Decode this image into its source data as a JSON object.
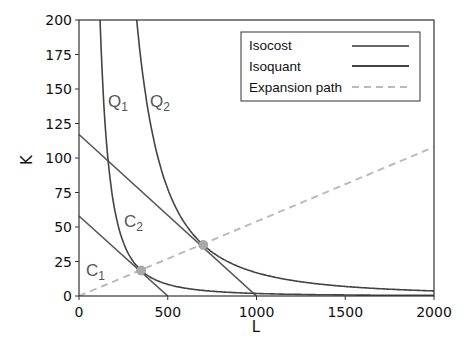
{
  "chart_data": {
    "type": "line",
    "title": "",
    "xlabel": "L",
    "ylabel": "K",
    "xlim": [
      0,
      2000
    ],
    "ylim": [
      0,
      200
    ],
    "xticks": [
      0,
      500,
      1000,
      1500,
      2000
    ],
    "yticks": [
      0,
      25,
      50,
      75,
      100,
      125,
      150,
      175,
      200
    ],
    "grid": false,
    "legend_position": "upper right",
    "legend": [
      {
        "label": "Isocost",
        "style": "solid",
        "color": "#666666"
      },
      {
        "label": "Isoquant",
        "style": "solid",
        "color": "#444444"
      },
      {
        "label": "Expansion path",
        "style": "dashed",
        "color": "#bbbbbb"
      }
    ],
    "series": [
      {
        "name": "Isocost C1",
        "label": "C1",
        "kind": "isocost",
        "points": [
          [
            0,
            58
          ],
          [
            500,
            0
          ]
        ]
      },
      {
        "name": "Isocost C2",
        "label": "C2",
        "kind": "isocost",
        "points": [
          [
            0,
            117
          ],
          [
            1000,
            0
          ]
        ]
      },
      {
        "name": "Isoquant Q1",
        "label": "Q1",
        "kind": "isoquant",
        "form": "K = K0*(L0/L)^a",
        "L0": 350,
        "K0": 18.5,
        "a": 2.2
      },
      {
        "name": "Isoquant Q2",
        "label": "Q2",
        "kind": "isoquant",
        "form": "K = K0*(L0/L)^a",
        "L0": 700,
        "K0": 37,
        "a": 2.2
      },
      {
        "name": "Expansion path",
        "kind": "expansion",
        "points": [
          [
            0,
            0
          ],
          [
            2000,
            108
          ]
        ]
      }
    ],
    "tangency_points": [
      [
        350,
        18.5
      ],
      [
        700,
        37
      ]
    ],
    "annotations": [
      {
        "text": "Q",
        "sub": "1",
        "at": [
          170,
          140
        ]
      },
      {
        "text": "Q",
        "sub": "2",
        "at": [
          400,
          140
        ]
      },
      {
        "text": "C",
        "sub": "2",
        "at": [
          270,
          58
        ]
      },
      {
        "text": "C",
        "sub": "1",
        "at": [
          70,
          19
        ]
      }
    ]
  },
  "legend": {
    "isocost": "Isocost",
    "isoquant": "Isoquant",
    "expansion": "Expansion path"
  },
  "axes": {
    "xlabel": "L",
    "ylabel": "K",
    "xticks": [
      "0",
      "500",
      "1000",
      "1500",
      "2000"
    ],
    "yticks": [
      "0",
      "25",
      "50",
      "75",
      "100",
      "125",
      "150",
      "175",
      "200"
    ]
  },
  "labels": {
    "q1": "Q",
    "q1_sub": "1",
    "q2": "Q",
    "q2_sub": "2",
    "c1": "C",
    "c1_sub": "1",
    "c2": "C",
    "c2_sub": "2"
  },
  "colors": {
    "isocost": "#555555",
    "isoquant": "#444444",
    "expansion": "#bbbbbb",
    "point": "#aaaaaa"
  }
}
